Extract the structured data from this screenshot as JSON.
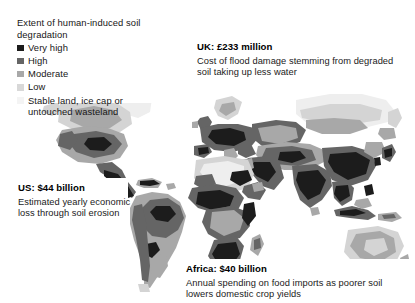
{
  "legend": {
    "title": "Extent of human-induced soil degradation",
    "items": [
      {
        "label": "Very high",
        "color": "#1c1c1c"
      },
      {
        "label": "High",
        "color": "#656565"
      },
      {
        "label": "Moderate",
        "color": "#a8a8a8"
      },
      {
        "label": "Low",
        "color": "#d8d8d8"
      },
      {
        "label": "Stable land, ice cap or untouched wasteland",
        "color": "#f4f4f4"
      }
    ]
  },
  "callouts": {
    "uk": {
      "title": "UK: £233 million",
      "body": "Cost of flood damage stemming from degraded soil taking up less water"
    },
    "us": {
      "title": "US: $44 billion",
      "body": "Estimated yearly economic loss through soil erosion"
    },
    "africa": {
      "title": "Africa: $40 billion",
      "body": "Annual spending on food imports as poorer soil lowers domestic crop yields"
    }
  },
  "map": {
    "name": "world-soil-degradation-map",
    "projection": "equirectangular",
    "background": "#ffffff",
    "regions": [
      {
        "name": "north-america",
        "degradation": "moderate"
      },
      {
        "name": "central-america",
        "degradation": "very-high"
      },
      {
        "name": "south-america",
        "degradation": "high"
      },
      {
        "name": "europe",
        "degradation": "high"
      },
      {
        "name": "north-africa",
        "degradation": "low"
      },
      {
        "name": "sub-saharan-africa",
        "degradation": "high"
      },
      {
        "name": "southern-africa",
        "degradation": "very-high"
      },
      {
        "name": "central-asia",
        "degradation": "moderate"
      },
      {
        "name": "south-asia",
        "degradation": "very-high"
      },
      {
        "name": "east-asia",
        "degradation": "very-high"
      },
      {
        "name": "southeast-asia",
        "degradation": "very-high"
      },
      {
        "name": "australia",
        "degradation": "low"
      },
      {
        "name": "new-zealand",
        "degradation": "low"
      }
    ]
  }
}
